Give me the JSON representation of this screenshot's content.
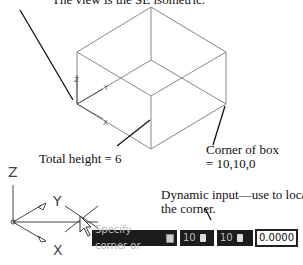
{
  "annotations": {
    "view": "The view is the SE isometric.",
    "height": "Total height = 6",
    "corner_line1": "Corner of box",
    "corner_line2": "= 10,10,0",
    "dynamic_line1": "Dynamic input—use to locate",
    "dynamic_line2": "the corner."
  },
  "small_ucs": {
    "z": "Z",
    "y": "Y",
    "x": "X"
  },
  "large_ucs": {
    "z": "Z",
    "y": "Y",
    "x": "X"
  },
  "dynamic_input": {
    "prompt": "Specify corner or",
    "prompt_icon": "down-arrow-icon",
    "field1_value": "10",
    "field1_icon": "lock-icon",
    "field2_value": "10",
    "field2_icon": "lock-icon",
    "field3_value": "0.0000"
  }
}
